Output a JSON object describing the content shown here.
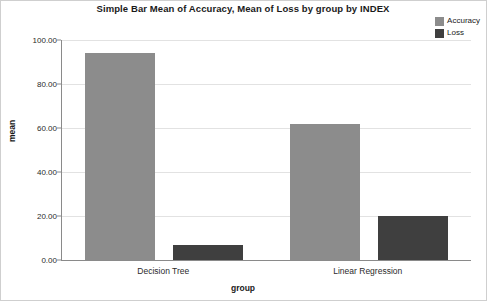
{
  "chart_data": {
    "type": "bar",
    "title": "Simple Bar Mean of Accuracy, Mean of Loss by group by INDEX",
    "xlabel": "group",
    "ylabel": "mean",
    "categories": [
      "Decision Tree",
      "Linear Regression"
    ],
    "series": [
      {
        "name": "Accuracy",
        "color": "#8c8c8c",
        "values": [
          94.0,
          62.0
        ]
      },
      {
        "name": "Loss",
        "color": "#3f3f3f",
        "values": [
          7.0,
          20.0
        ]
      }
    ],
    "ylim": [
      0,
      100
    ],
    "yticks": [
      0,
      20,
      40,
      60,
      80,
      100
    ],
    "ytick_labels": [
      "0.00",
      "20.00",
      "40.00",
      "60.00",
      "80.00",
      "100.00"
    ],
    "grid": true,
    "legend_position": "top-right"
  },
  "legend": {
    "entries": [
      {
        "label": "Accuracy",
        "color": "#8c8c8c"
      },
      {
        "label": "Loss",
        "color": "#3f3f3f"
      }
    ]
  }
}
